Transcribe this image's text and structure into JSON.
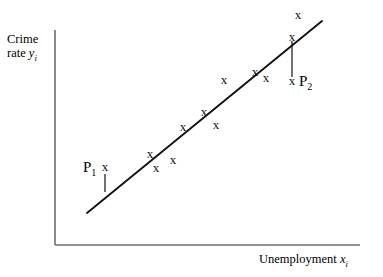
{
  "figure": {
    "background_color": "#ffffff",
    "ink_color": "#111111",
    "axis_color": "#6e6e6e",
    "width": 383,
    "height": 277
  },
  "axes": {
    "y_label_line1": "Crime",
    "y_label_line2_prefix": "rate ",
    "y_label_variable": "y",
    "y_label_subscript": "i",
    "x_label_prefix": "Unemployment ",
    "x_label_variable": "x",
    "x_label_subscript": "i",
    "origin_x": 55,
    "origin_y": 245,
    "y_axis_top": 30,
    "x_axis_right": 360
  },
  "annotations": {
    "p1_text": "P",
    "p1_subscript": "1",
    "p2_text": "P",
    "p2_subscript": "2"
  },
  "chart_data": {
    "type": "scatter",
    "title": "",
    "xlabel": "Unemployment x_i",
    "ylabel": "Crime rate y_i",
    "grid": false,
    "legend": "none",
    "axis_ticks": "none",
    "marker_glyph": "x",
    "xlim": [
      55,
      360
    ],
    "ylim": [
      245,
      30
    ],
    "regression_line": {
      "label": "fitted regression line",
      "x1": 87,
      "y1": 213,
      "x2": 322,
      "y2": 21
    },
    "points": [
      {
        "id": "pt-p1",
        "x": 105,
        "y": 168,
        "position": "above-line",
        "labeled": "P1"
      },
      {
        "id": "pt-1",
        "x": 150,
        "y": 155,
        "position": "on-line",
        "labeled": ""
      },
      {
        "id": "pt-2",
        "x": 156,
        "y": 169,
        "position": "below-line",
        "labeled": ""
      },
      {
        "id": "pt-3",
        "x": 173,
        "y": 161,
        "position": "below-line",
        "labeled": ""
      },
      {
        "id": "pt-4",
        "x": 183,
        "y": 128,
        "position": "on-line",
        "labeled": ""
      },
      {
        "id": "pt-5",
        "x": 204,
        "y": 113,
        "position": "on-line",
        "labeled": ""
      },
      {
        "id": "pt-6",
        "x": 216,
        "y": 126,
        "position": "below-line",
        "labeled": ""
      },
      {
        "id": "pt-7",
        "x": 224,
        "y": 81,
        "position": "above-line",
        "labeled": ""
      },
      {
        "id": "pt-8",
        "x": 255,
        "y": 73,
        "position": "above-line",
        "labeled": ""
      },
      {
        "id": "pt-9",
        "x": 266,
        "y": 79,
        "position": "on-line",
        "labeled": ""
      },
      {
        "id": "pt-10",
        "x": 292,
        "y": 38,
        "position": "on-line",
        "labeled": ""
      },
      {
        "id": "pt-11",
        "x": 298,
        "y": 16,
        "position": "above-line",
        "labeled": ""
      },
      {
        "id": "pt-p2",
        "x": 292,
        "y": 82,
        "position": "below-line",
        "labeled": "P2"
      }
    ],
    "residual_leaders": [
      {
        "id": "leader-p1",
        "x": 105,
        "y_start": 174,
        "y_end": 192,
        "point": "P1"
      },
      {
        "id": "leader-p2",
        "x": 292,
        "y_start": 41,
        "y_end": 77,
        "point": "P2"
      }
    ]
  }
}
